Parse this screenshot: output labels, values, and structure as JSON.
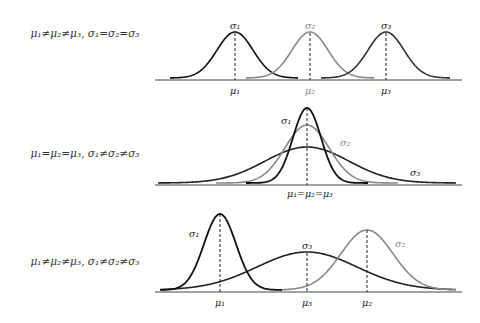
{
  "panels": [
    {
      "condition": "μ₁≠μ₂≠μ₃, σ₁=σ₂=σ₃",
      "curves": [
        {
          "sigma_label": "σ₁",
          "mu_label": "μ₁",
          "color": "#111111"
        },
        {
          "sigma_label": "σ₂",
          "mu_label": "μ₂",
          "color": "#888888"
        },
        {
          "sigma_label": "σ₃",
          "mu_label": "μ₃",
          "color": "#333333"
        }
      ]
    },
    {
      "condition": "μ₁=μ₂=μ₃, σ₁≠σ₂≠σ₃",
      "curves": [
        {
          "sigma_label": "σ₁",
          "color": "#111111"
        },
        {
          "sigma_label": "σ₂",
          "color": "#888888"
        },
        {
          "sigma_label": "σ₃",
          "color": "#333333"
        }
      ],
      "mu_label": "μ₁=μ₂=μ₃"
    },
    {
      "condition": "μ₁≠μ₂≠μ₃, σ₁≠σ₂≠σ₃",
      "curves": [
        {
          "sigma_label": "σ₁",
          "mu_label": "μ₁",
          "color": "#111111"
        },
        {
          "sigma_label": "σ₂",
          "mu_label": "μ₂",
          "color": "#888888"
        },
        {
          "sigma_label": "σ₃",
          "mu_label": "μ₃",
          "color": "#333333"
        }
      ]
    }
  ]
}
